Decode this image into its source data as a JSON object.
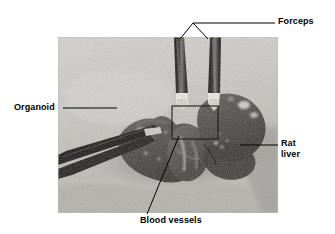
{
  "figure": {
    "kind": "annotated-photograph",
    "background_color": "#ffffff",
    "photo": {
      "left": 58,
      "top": 37,
      "width": 220,
      "height": 176,
      "description": "Grayscale photograph of a rat liver with an attached organoid being held by two forceps",
      "colors": {
        "background_light": "#cfcfcb",
        "background_mid": "#b9b9b4",
        "tissue_dark": "#4c4a46",
        "tissue_mid": "#6b6864",
        "tissue_light": "#8a8782",
        "forceps_dark": "#1c1b19",
        "forceps_highlight": "#e8e6e0",
        "roi_box_stroke": "#000000"
      },
      "roi_box": {
        "x": 172,
        "y": 106,
        "width": 46,
        "height": 33
      }
    },
    "line_color": "#000000",
    "line_width": 1
  },
  "annotations": [
    {
      "id": "forceps",
      "label": "Forceps",
      "text_x": 278,
      "text_y": 16,
      "leader": {
        "type": "branched",
        "trunk": {
          "x1": 275,
          "y1": 23,
          "x2": 193,
          "y2": 23
        },
        "branches": [
          {
            "x1": 193,
            "y1": 23,
            "x2": 180,
            "y2": 39
          },
          {
            "x1": 193,
            "y1": 23,
            "x2": 208,
            "y2": 39
          }
        ]
      }
    },
    {
      "id": "organoid",
      "label": "Organoid",
      "text_x": 14,
      "text_y": 102,
      "leader": {
        "type": "straight",
        "trunk": {
          "x1": 63,
          "y1": 108,
          "x2": 117,
          "y2": 108
        },
        "branches": []
      }
    },
    {
      "id": "rat-liver",
      "label": "Rat\nliver",
      "text_x": 281,
      "text_y": 138,
      "leader": {
        "type": "straight",
        "trunk": {
          "x1": 278,
          "y1": 145,
          "x2": 240,
          "y2": 145
        },
        "branches": []
      }
    },
    {
      "id": "blood-vessels",
      "label": "Blood vessels",
      "text_x": 140,
      "text_y": 215,
      "leader": {
        "type": "straight",
        "trunk": {
          "x1": 147,
          "y1": 214,
          "x2": 179,
          "y2": 136
        },
        "branches": []
      }
    }
  ]
}
